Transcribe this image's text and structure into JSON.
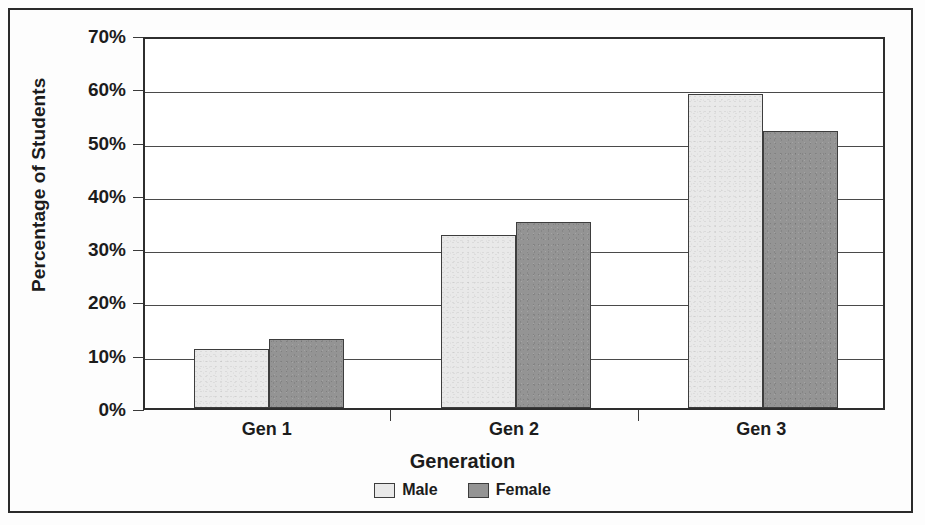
{
  "chart_data": {
    "type": "bar",
    "title": "",
    "xlabel": "Generation",
    "ylabel": "Percentage of Students",
    "categories": [
      "Gen 1",
      "Gen 2",
      "Gen 3"
    ],
    "series": [
      {
        "name": "Male",
        "values": [
          11,
          32.5,
          59
        ],
        "color": "#e9e9e9"
      },
      {
        "name": "Female",
        "values": [
          13,
          35,
          52
        ],
        "color": "#949494"
      }
    ],
    "ylim": [
      0,
      70
    ],
    "ytick_values": [
      0,
      10,
      20,
      30,
      40,
      50,
      60,
      70
    ],
    "ytick_labels": [
      "0%",
      "10%",
      "20%",
      "30%",
      "40%",
      "50%",
      "60%",
      "70%"
    ],
    "grid": true,
    "grid_axis": "y",
    "legend_position": "bottom",
    "legend_entries": [
      "Male",
      "Female"
    ],
    "bar_outline_color": "#3d3d3d",
    "axis_color": "#2e2e2e"
  },
  "axes": {
    "y_title": "Percentage of Students",
    "x_title": "Generation"
  },
  "legend": {
    "items": [
      {
        "label": "Male",
        "swatch": "light-gray-swatch"
      },
      {
        "label": "Female",
        "swatch": "dark-gray-swatch"
      }
    ]
  }
}
